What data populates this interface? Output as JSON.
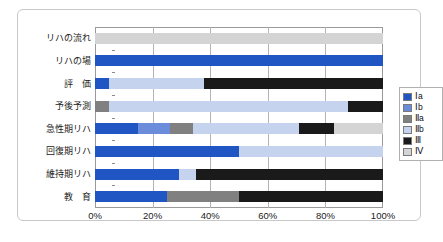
{
  "chart_data": {
    "type": "bar",
    "orientation": "horizontal",
    "stacked": "100%",
    "title": "",
    "xlabel": "",
    "ylabel": "",
    "xlim": [
      0,
      100
    ],
    "grid": true,
    "legend_position": "right",
    "xticks": [
      "0%",
      "20%",
      "40%",
      "60%",
      "80%",
      "100%"
    ],
    "xtick_values": [
      0,
      20,
      40,
      60,
      80,
      100
    ],
    "categories": [
      "リハの流れ",
      "リハの場",
      "評　価",
      "予後予測",
      "急性期リハ",
      "回復期リハ",
      "維持期リハ",
      "教　育"
    ],
    "series": [
      {
        "name": "Ⅰa",
        "color": "#1F56C3",
        "values": [
          0,
          100,
          5,
          0,
          15,
          50,
          29,
          25
        ]
      },
      {
        "name": "Ⅰb",
        "color": "#6B8BDB",
        "values": [
          0,
          0,
          0,
          0,
          11,
          0,
          0,
          0
        ]
      },
      {
        "name": "Ⅱa",
        "color": "#808080",
        "values": [
          0,
          0,
          0,
          5,
          8,
          0,
          0,
          25
        ]
      },
      {
        "name": "Ⅱb",
        "color": "#C6D3EF",
        "values": [
          0,
          0,
          33,
          83,
          37,
          50,
          6,
          0
        ]
      },
      {
        "name": "Ⅲ",
        "color": "#1A1A1A",
        "values": [
          0,
          0,
          62,
          12,
          12,
          0,
          65,
          50
        ]
      },
      {
        "name": "Ⅳ",
        "color": "#D4D4D4",
        "values": [
          100,
          0,
          0,
          0,
          17,
          0,
          0,
          0
        ]
      }
    ]
  }
}
